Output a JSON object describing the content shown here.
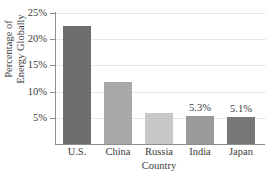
{
  "chart_data": {
    "type": "bar",
    "title": "",
    "xlabel": "Country",
    "ylabel": "Percentage of Energy Globally",
    "ylabel_line1": "Percentage of",
    "ylabel_line2": "Energy Globally",
    "categories": [
      "U.S.",
      "China",
      "Russia",
      "India",
      "Japan"
    ],
    "values": [
      22.5,
      11.9,
      5.9,
      5.3,
      5.1
    ],
    "point_labels": [
      "",
      "",
      "",
      "5.3%",
      "5.1%"
    ],
    "bar_colors": [
      "#6e6e6e",
      "#a8a8a8",
      "#c8c8c8",
      "#9a9a9a",
      "#777777"
    ],
    "ylim": [
      0,
      25
    ],
    "yticks": [
      5,
      10,
      15,
      20,
      25
    ],
    "ytick_labels": [
      "5%",
      "10%",
      "15%",
      "20%",
      "25%"
    ],
    "grid": true,
    "grid_axis": "y",
    "legend": "none",
    "axis_color": "#8d8d8d",
    "grid_color": "#e8e8e8",
    "text_color": "#3b3b3b",
    "background": "#ffffff"
  }
}
